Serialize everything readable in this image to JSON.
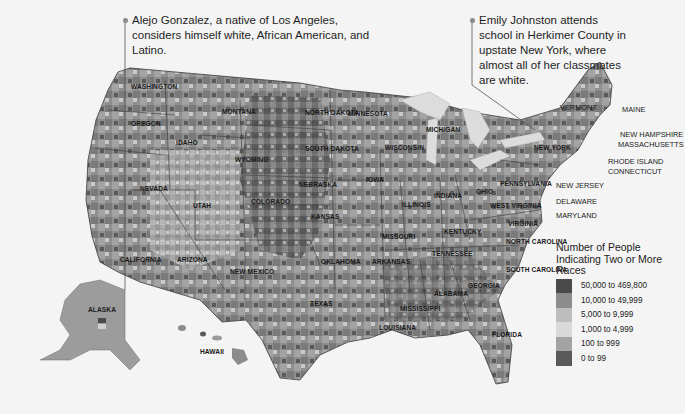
{
  "callouts": [
    {
      "text": "Alejo Gonzalez, a native of Los Angeles, considers himself white, African American, and Latino."
    },
    {
      "text": "Emily Johnston attends school in Herkimer County in upstate New York, where almost all of her classmates are white."
    }
  ],
  "states": {
    "washington": "WASHINGTON",
    "oregon": "OREGON",
    "idaho": "IDAHO",
    "montana": "MONTANA",
    "wyoming": "WYOMING",
    "nevada": "NEVADA",
    "utah": "UTAH",
    "colorado": "COLORADO",
    "california": "CALIFORNIA",
    "arizona": "ARIZONA",
    "new_mexico": "NEW MEXICO",
    "north_dakota": "NORTH DAKOTA",
    "south_dakota": "SOUTH DAKOTA",
    "nebraska": "NEBRASKA",
    "kansas": "KANSAS",
    "oklahoma": "OKLAHOMA",
    "texas": "TEXAS",
    "minnesota": "MINNESOTA",
    "iowa": "IOWA",
    "missouri": "MISSOURI",
    "arkansas": "ARKANSAS",
    "louisiana": "LOUISIANA",
    "wisconsin": "WISCONSIN",
    "illinois": "ILLINOIS",
    "michigan": "MICHIGAN",
    "indiana": "INDIANA",
    "ohio": "OHIO",
    "kentucky": "KENTUCKY",
    "tennessee": "TENNESSEE",
    "mississippi": "MISSISSIPPI",
    "alabama": "ALABAMA",
    "georgia": "GEORGIA",
    "florida": "FLORIDA",
    "south_carolina": "SOUTH CAROLINA",
    "north_carolina": "NORTH CAROLINA",
    "virginia": "VIRGINIA",
    "west_virginia": "WEST VIRGINIA",
    "pennsylvania": "PENNSYLVANIA",
    "new_york": "NEW YORK",
    "vermont": "VERMONT",
    "maine": "MAINE",
    "new_hampshire": "NEW HAMPSHIRE",
    "massachusetts": "MASSACHUSETTS",
    "rhode_island": "RHODE ISLAND",
    "connecticut": "CONNECTICUT",
    "new_jersey": "NEW JERSEY",
    "delaware": "DELAWARE",
    "maryland": "MARYLAND",
    "alaska": "ALASKA",
    "hawaii": "HAWAII"
  },
  "legend": {
    "title": "Number of People Indicating Two or More Races",
    "items": [
      {
        "label": "50,000 to 469,800",
        "color": "#4a4a4a"
      },
      {
        "label": "10,000 to 49,999",
        "color": "#8c8c8c"
      },
      {
        "label": "5,000 to 9,999",
        "color": "#bdbdbd"
      },
      {
        "label": "1,000 to 4,999",
        "color": "#d9d9d9"
      },
      {
        "label": "100 to 999",
        "color": "#a3a3a3"
      },
      {
        "label": "0 to 99",
        "color": "#5a5a5a"
      }
    ]
  },
  "colors": {
    "background": "#f4f4f4",
    "water": "#e0e0e0",
    "state_border": "#3a3a3a"
  }
}
